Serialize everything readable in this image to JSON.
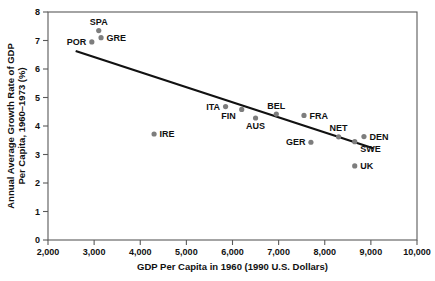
{
  "chart_data": {
    "type": "scatter",
    "title": "",
    "xlabel": "GDP Per Capita in 1960 (1990 U.S. Dollars)",
    "ylabel": "Annual Average Growth Rate of GDP Per Capita, 1960–1973 (%)",
    "ylabel_line1": "Annual Average Growth Rate of GDP",
    "ylabel_line2": "Per Capita, 1960–1973 (%)",
    "xlim": [
      2000,
      10000
    ],
    "ylim": [
      0,
      8
    ],
    "grid": false,
    "legend": "none",
    "xticks": [
      2000,
      3000,
      4000,
      5000,
      6000,
      7000,
      8000,
      9000,
      10000
    ],
    "xticklabels": [
      "2,000",
      "3,000",
      "4,000",
      "5,000",
      "6,000",
      "7,000",
      "8,000",
      "9,000",
      "10,000"
    ],
    "yticks": [
      0,
      1,
      2,
      3,
      4,
      5,
      6,
      7,
      8
    ],
    "yticklabels": [
      "0",
      "1",
      "2",
      "3",
      "4",
      "5",
      "6",
      "7",
      "8"
    ],
    "marker_color": "#7d7d7d",
    "trendline_color": "#111111",
    "points": [
      {
        "label": "POR",
        "x": 2950,
        "y": 6.95,
        "label_pos": "left"
      },
      {
        "label": "SPA",
        "x": 3100,
        "y": 7.35,
        "label_pos": "above"
      },
      {
        "label": "GRE",
        "x": 3150,
        "y": 7.1,
        "label_pos": "right"
      },
      {
        "label": "IRE",
        "x": 4300,
        "y": 3.72,
        "label_pos": "right"
      },
      {
        "label": "ITA",
        "x": 5850,
        "y": 4.68,
        "label_pos": "left"
      },
      {
        "label": "FIN",
        "x": 6200,
        "y": 4.58,
        "label_pos": "belowleft"
      },
      {
        "label": "AUS",
        "x": 6500,
        "y": 4.28,
        "label_pos": "below"
      },
      {
        "label": "BEL",
        "x": 6950,
        "y": 4.42,
        "label_pos": "above"
      },
      {
        "label": "FRA",
        "x": 7550,
        "y": 4.37,
        "label_pos": "right"
      },
      {
        "label": "GER",
        "x": 7700,
        "y": 3.43,
        "label_pos": "left"
      },
      {
        "label": "NET",
        "x": 8300,
        "y": 3.62,
        "label_pos": "above"
      },
      {
        "label": "SWE",
        "x": 8650,
        "y": 3.45,
        "label_pos": "belowright"
      },
      {
        "label": "DEN",
        "x": 8850,
        "y": 3.63,
        "label_pos": "right"
      },
      {
        "label": "UK",
        "x": 8650,
        "y": 2.6,
        "label_pos": "right"
      }
    ],
    "trendline": {
      "x0": 2600,
      "y0": 6.63,
      "x1": 9050,
      "y1": 3.22
    }
  }
}
